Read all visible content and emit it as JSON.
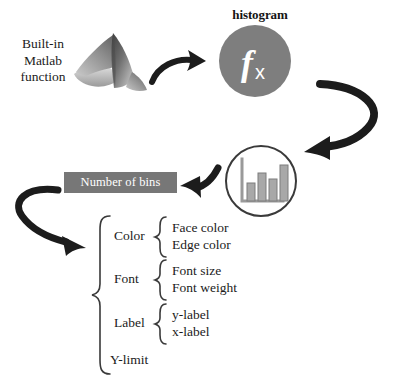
{
  "diagram": {
    "background_color": "#ffffff"
  },
  "source": {
    "label": "Built-in\nMatlab\nfunction",
    "label_line1": "Built-in",
    "label_line2": "Matlab",
    "label_line3": "function",
    "icon_name": "matlab-membrane-logo"
  },
  "function_node": {
    "title": "histogram",
    "glyph": "fx",
    "circle_color": "#7e7e7e",
    "glyph_color": "#ffffff"
  },
  "chart_node": {
    "icon_name": "bar-chart-icon",
    "outline_color": "#3a3a3a",
    "bar_color": "#a8a8a8",
    "bar_stroke": "#6e6e6e",
    "bars": [
      38,
      62,
      46,
      82
    ]
  },
  "bins_node": {
    "label": "Number of bins",
    "background_color": "#777777",
    "text_color": "#ffffff"
  },
  "properties": {
    "groups": [
      {
        "name": "Color",
        "items": [
          "Face color",
          "Edge color"
        ]
      },
      {
        "name": "Font",
        "items": [
          "Font size",
          "Font weight"
        ]
      },
      {
        "name": "Label",
        "items": [
          "y-label",
          "x-label"
        ]
      },
      {
        "name": "Y-limit",
        "items": []
      }
    ]
  },
  "arrows": [
    {
      "name": "arrow-source-to-function",
      "direction": "right"
    },
    {
      "name": "arrow-function-to-chart",
      "direction": "down-left-curve"
    },
    {
      "name": "arrow-chart-to-bins",
      "direction": "left"
    },
    {
      "name": "arrow-bins-to-properties",
      "direction": "down-right-hook"
    }
  ],
  "colors": {
    "arrow": "#1c1c1c",
    "text": "#1b1b1b",
    "brace": "#3a3a3a"
  }
}
